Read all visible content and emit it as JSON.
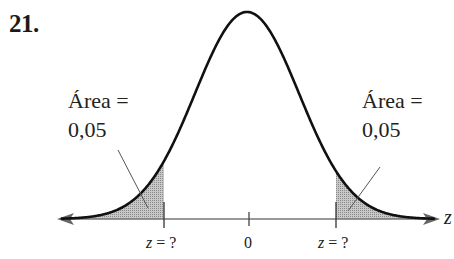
{
  "problem": {
    "number": "21."
  },
  "figure": {
    "type": "normal_distribution_two_tailed",
    "left_area": {
      "line1": "Área =",
      "line2": "0,05"
    },
    "right_area": {
      "line1": "Área =",
      "line2": "0,05"
    },
    "axis_label": "z",
    "ticks": [
      {
        "id": "left-cutoff",
        "text_var": "z",
        "text_rest": " = ?"
      },
      {
        "id": "center",
        "text": "0"
      },
      {
        "id": "right-cutoff",
        "text_var": "z",
        "text_rest": " = ?"
      }
    ],
    "colors": {
      "curve": "#111111",
      "shade": "#b5b5b5",
      "axis": "#6e6e6e",
      "text": "#222222"
    }
  }
}
